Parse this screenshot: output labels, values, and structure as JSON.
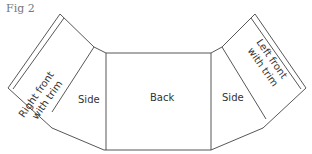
{
  "figure": {
    "label": "Fig 2"
  },
  "pieces": {
    "right_front": {
      "line1": "Right front",
      "line2": "with trim"
    },
    "left_side": "Side",
    "back": "Back",
    "right_side": "Side",
    "left_front": {
      "line1": "Left front",
      "line2": "with trim"
    }
  }
}
